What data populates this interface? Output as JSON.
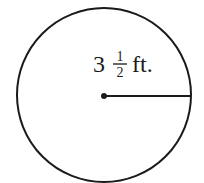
{
  "diagram": {
    "shape": "circle",
    "radius_label": {
      "whole": "3",
      "numerator": "1",
      "denominator": "2",
      "unit": "ft."
    },
    "colors": {
      "stroke": "#1a1a1a",
      "background": "#ffffff"
    }
  }
}
